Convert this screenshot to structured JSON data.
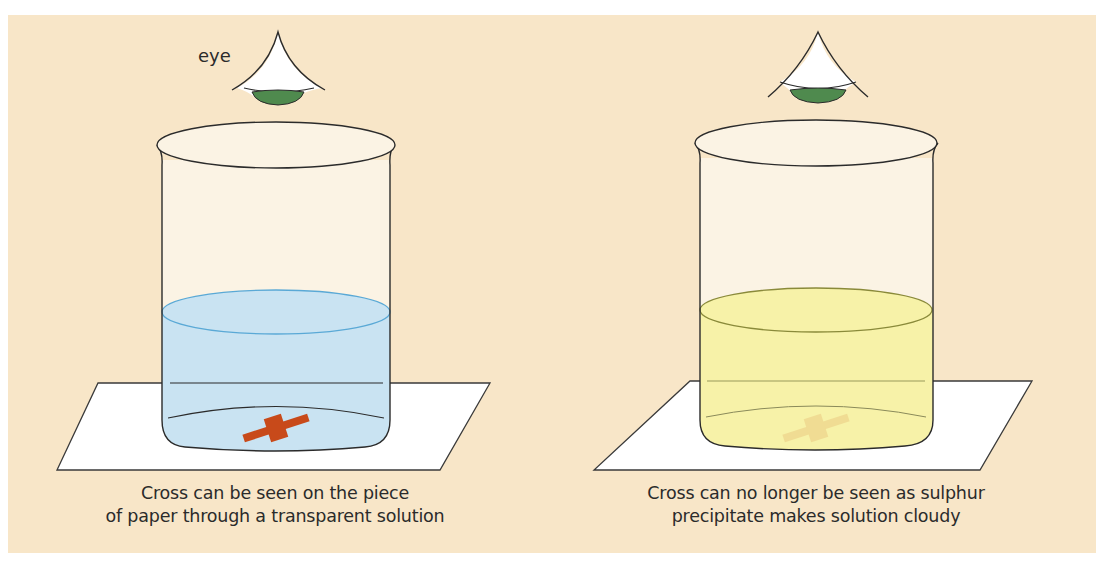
{
  "figure": {
    "eye_label": "eye",
    "panels": [
      {
        "id": "left",
        "solution": "transparent",
        "liquid_color": "#c9e3f2",
        "liquid_outline": "#5aa9d6",
        "cross_color": "#c84a1a",
        "cross_visible": true,
        "caption_line1": "Cross can be seen on the piece",
        "caption_line2": "of paper through a transparent solution"
      },
      {
        "id": "right",
        "solution": "cloudy",
        "liquid_color": "#f7f2a8",
        "liquid_outline": "#8a8a3a",
        "cross_color": "#e8c27a",
        "cross_visible": false,
        "caption_line1": "Cross can no longer be seen as sulphur",
        "caption_line2": "precipitate makes solution cloudy"
      }
    ],
    "colors": {
      "background": "#f8e6c8",
      "paper": "#ffffff",
      "outline": "#2b2b2b",
      "iris": "#4f8a4e"
    }
  }
}
